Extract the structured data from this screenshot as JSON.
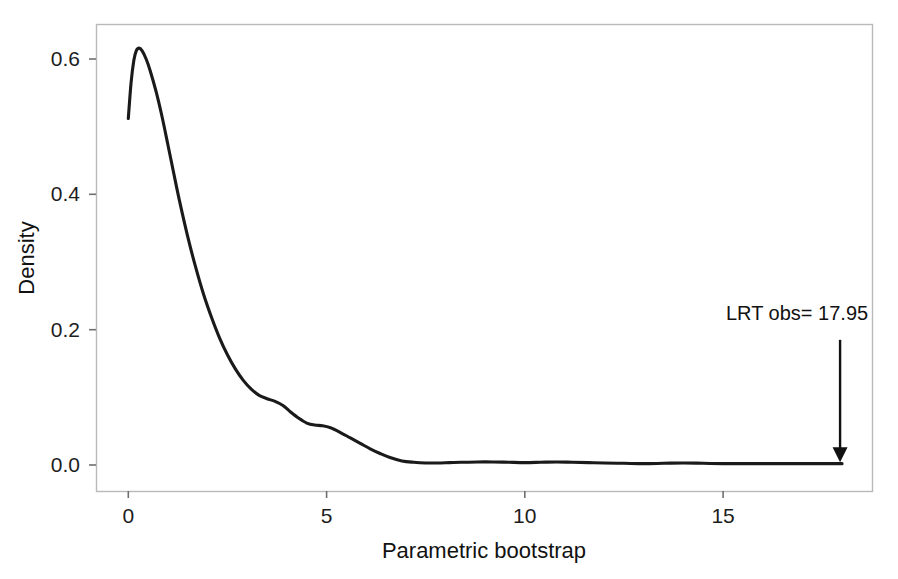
{
  "figure": {
    "background_color": "#ffffff",
    "frame_color": "#b9b9b9",
    "curve_color": "#1a1a1a",
    "text_color": "#1a1a1a"
  },
  "chart_data": {
    "type": "line",
    "title": "",
    "subtitle": "",
    "xlabel": "Parametric bootstrap",
    "ylabel": "Density",
    "xlim": [
      -0.8,
      18.75
    ],
    "ylim": [
      -0.022,
      0.655
    ],
    "xticks": [
      0,
      5,
      10,
      15
    ],
    "xtick_labels": [
      "0",
      "5",
      "10",
      "15"
    ],
    "yticks": [
      0.0,
      0.2,
      0.4,
      0.6
    ],
    "ytick_labels": [
      "0.0",
      "0.2",
      "0.4",
      "0.6"
    ],
    "grid": false,
    "legend": null,
    "legend_position": "none",
    "series": [
      {
        "name": "Bootstrap LRT density",
        "x": [
          0.0,
          0.07,
          0.14,
          0.2,
          0.27,
          0.35,
          0.45,
          0.55,
          0.7,
          0.85,
          1.0,
          1.15,
          1.3,
          1.5,
          1.7,
          1.9,
          2.1,
          2.3,
          2.5,
          2.7,
          2.9,
          3.1,
          3.3,
          3.5,
          3.7,
          3.9,
          4.1,
          4.3,
          4.5,
          4.7,
          4.9,
          5.1,
          5.35,
          5.6,
          5.85,
          6.1,
          6.35,
          6.6,
          6.9,
          7.2,
          7.5,
          7.8,
          8.1,
          8.4,
          8.8,
          9.2,
          9.6,
          10.0,
          10.4,
          10.8,
          11.2,
          11.6,
          12.0,
          12.5,
          13.0,
          13.5,
          14.0,
          14.5,
          15.0,
          15.5,
          16.0,
          16.5,
          17.0,
          17.5,
          18.0
        ],
        "y": [
          0.512,
          0.565,
          0.598,
          0.612,
          0.616,
          0.612,
          0.6,
          0.583,
          0.552,
          0.515,
          0.473,
          0.43,
          0.388,
          0.337,
          0.292,
          0.252,
          0.218,
          0.188,
          0.163,
          0.142,
          0.125,
          0.112,
          0.103,
          0.098,
          0.094,
          0.088,
          0.078,
          0.069,
          0.062,
          0.059,
          0.058,
          0.055,
          0.048,
          0.04,
          0.032,
          0.024,
          0.017,
          0.011,
          0.006,
          0.004,
          0.003,
          0.003,
          0.0035,
          0.004,
          0.0045,
          0.0045,
          0.004,
          0.0035,
          0.004,
          0.0045,
          0.004,
          0.0035,
          0.003,
          0.0025,
          0.002,
          0.0025,
          0.003,
          0.0025,
          0.002,
          0.002,
          0.002,
          0.002,
          0.002,
          0.002,
          0.002
        ]
      }
    ],
    "annotations": [
      {
        "name": "lrt-observed",
        "text": "LRT obs= 17.95",
        "x": 17.95,
        "y_text": 0.215,
        "arrow_from_y": 0.185,
        "arrow_to_y": 0.004,
        "marker": "down-arrow"
      }
    ]
  }
}
